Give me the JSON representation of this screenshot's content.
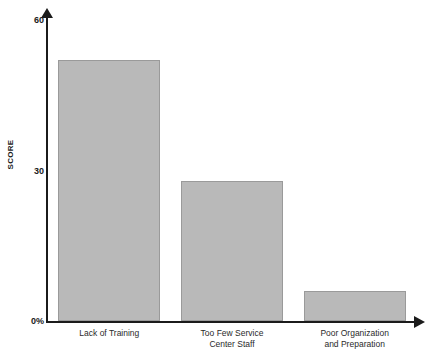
{
  "chart_data": {
    "type": "bar",
    "title": "",
    "xlabel": "",
    "ylabel": "SCORE",
    "categories": [
      "Lack of Training",
      "Too Few Service\nCenter Staff",
      "Poor Organization\nand Preparation"
    ],
    "values": [
      52,
      28,
      6
    ],
    "ylim": [
      0,
      60
    ],
    "ytick_values": [
      0,
      30,
      60
    ],
    "ytick_labels": [
      "0%",
      "30",
      "60"
    ],
    "grid": false,
    "legend": null,
    "bar_color": "#b9b9b9",
    "bar_border_color": "#9a9a9a",
    "axis_color": "#1b1b1b",
    "background_color": "#ffffff"
  },
  "axes": {
    "y_title": "SCORE",
    "y_arrow": "up-arrow-icon",
    "x_arrow": "right-arrow-icon"
  }
}
